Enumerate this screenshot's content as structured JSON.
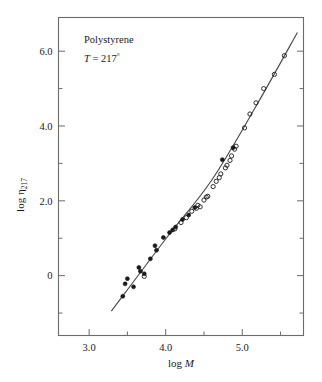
{
  "chart_data": {
    "type": "scatter",
    "title": "",
    "subtitle": "",
    "xlabel": "log M",
    "ylabel": "log η217",
    "xlabel_parts": {
      "prefix": "log ",
      "italic": "M"
    },
    "ylabel_parts": {
      "prefix": "log ",
      "symbol": "η",
      "subscript": "217"
    },
    "xlim": [
      2.6,
      5.8
    ],
    "ylim": [
      -1.6,
      6.9
    ],
    "grid": false,
    "legend": null,
    "x_ticks_major": [
      3.0,
      4.0,
      5.0
    ],
    "x_ticks_major_labels": [
      "3.0",
      "4.0",
      "5.0"
    ],
    "x_ticks_minor": [
      3.5,
      4.5,
      5.5
    ],
    "y_ticks_major": [
      0,
      2.0,
      4.0,
      6.0
    ],
    "y_ticks_major_labels": [
      "0",
      "2.0",
      "4.0",
      "6.0"
    ],
    "y_ticks_minor": [
      -1.0,
      1.0,
      3.0,
      5.0
    ],
    "annotations": [
      {
        "id": "sample-name",
        "text": "Polystyrene",
        "x": 3.05,
        "y": 6.35,
        "italic": false
      },
      {
        "id": "temperature",
        "text": "T = 217°",
        "x": 3.05,
        "y": 5.75,
        "italic_lead": "T",
        "rest": " = 217",
        "degree": "°"
      }
    ],
    "fit_line": {
      "description": "piecewise fit through data with bend near log M = 4.6",
      "points": [
        [
          3.29,
          -0.95
        ],
        [
          4.0,
          0.98
        ],
        [
          4.6,
          2.55
        ],
        [
          5.2,
          4.6
        ],
        [
          5.72,
          6.5
        ]
      ]
    },
    "series": [
      {
        "name": "filled-circles",
        "marker": "filled-circle",
        "color": "#1a1a1a",
        "points": [
          [
            3.44,
            -0.55
          ],
          [
            3.47,
            -0.22
          ],
          [
            3.5,
            -0.08
          ],
          [
            3.58,
            -0.3
          ],
          [
            3.65,
            0.22
          ],
          [
            3.67,
            0.12
          ],
          [
            3.72,
            0.05
          ],
          [
            3.8,
            0.45
          ],
          [
            3.86,
            0.8
          ],
          [
            3.88,
            0.68
          ],
          [
            3.97,
            1.02
          ],
          [
            4.05,
            1.15
          ],
          [
            4.09,
            1.22
          ],
          [
            4.13,
            1.3
          ],
          [
            4.22,
            1.5
          ],
          [
            4.3,
            1.62
          ],
          [
            4.38,
            1.82
          ],
          [
            4.74,
            3.1
          ],
          [
            4.88,
            3.42
          ]
        ]
      },
      {
        "name": "open-circles",
        "marker": "open-circle",
        "color": "#1a1a1a",
        "points": [
          [
            3.72,
            -0.02
          ],
          [
            4.12,
            1.25
          ],
          [
            4.2,
            1.42
          ],
          [
            4.27,
            1.55
          ],
          [
            4.34,
            1.72
          ],
          [
            4.4,
            1.8
          ],
          [
            4.42,
            1.88
          ],
          [
            4.45,
            1.84
          ],
          [
            4.5,
            2.02
          ],
          [
            4.53,
            2.1
          ],
          [
            4.55,
            2.12
          ],
          [
            4.62,
            2.38
          ],
          [
            4.66,
            2.52
          ],
          [
            4.7,
            2.62
          ],
          [
            4.72,
            2.72
          ],
          [
            4.78,
            2.88
          ],
          [
            4.8,
            2.95
          ],
          [
            4.84,
            3.08
          ],
          [
            4.86,
            3.2
          ],
          [
            4.9,
            3.38
          ],
          [
            4.92,
            3.46
          ],
          [
            5.03,
            3.95
          ],
          [
            5.1,
            4.32
          ],
          [
            5.18,
            4.62
          ],
          [
            5.28,
            5.0
          ],
          [
            5.42,
            5.38
          ],
          [
            5.55,
            5.88
          ]
        ]
      }
    ]
  },
  "axes": {
    "frame_color": "#6b6b6b",
    "ink_color": "#1a1a1a"
  }
}
